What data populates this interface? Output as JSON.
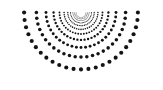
{
  "canvas": {
    "width": 163,
    "height": 90,
    "background_color": "#ffffff",
    "title": "Radial dot sunburst"
  },
  "figure": {
    "name": "radial-dot-sunburst",
    "dot_color": "#141414",
    "center": {
      "x": 81,
      "y": 12.5
    },
    "angle_start_deg": 0,
    "angle_end_deg": 180,
    "ray_count": 25,
    "ring_count": 11,
    "radius_min": 5.0,
    "radius_max": 69.0,
    "radius_growth": 1.275,
    "dot_size_min": 0.55,
    "dot_size_max": 4.1,
    "dot_size_growth": 1.23
  },
  "chart_data": {
    "type": "scatter",
    "xlabel": "",
    "ylabel": "",
    "xlim": [
      0,
      163
    ],
    "ylim": [
      0,
      90
    ],
    "grid": false,
    "legend": "none",
    "coordinate_system": "polar-semicircle",
    "center": {
      "x": 81,
      "y": 12.5
    },
    "angles_deg": [
      0,
      7.5,
      15,
      22.5,
      30,
      37.5,
      45,
      52.5,
      60,
      67.5,
      75,
      82.5,
      90,
      97.5,
      105,
      112.5,
      120,
      127.5,
      135,
      142.5,
      150,
      157.5,
      165,
      172.5,
      180
    ],
    "radii": [
      5.0,
      6.4,
      8.1,
      10.4,
      13.2,
      16.9,
      21.5,
      27.4,
      35.0,
      44.6,
      56.9
    ],
    "marker_sizes": [
      0.55,
      0.68,
      0.83,
      1.03,
      1.26,
      1.55,
      1.91,
      2.35,
      2.89,
      3.55,
      4.1
    ],
    "marker_color": "#141414",
    "marker_shape": "circle",
    "annotations": []
  }
}
